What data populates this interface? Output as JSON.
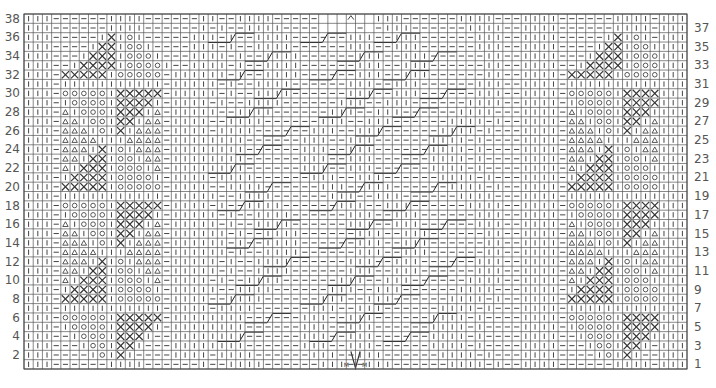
{
  "chart": {
    "rows": 38,
    "cols": 72,
    "grid": {
      "left": 24,
      "top": 14,
      "right": 687,
      "bottom": 369
    },
    "colors": {
      "line": "#555555",
      "symbol": "#444444",
      "background": "#ffffff"
    },
    "left_row_numbers": [
      "2",
      "4",
      "6",
      "8",
      "10",
      "12",
      "14",
      "16",
      "18",
      "20",
      "22",
      "24",
      "26",
      "28",
      "30",
      "32",
      "34",
      "36",
      "38"
    ],
    "right_row_numbers": [
      "1",
      "3",
      "5",
      "7",
      "9",
      "11",
      "13",
      "15",
      "17",
      "19",
      "21",
      "23",
      "25",
      "27",
      "29",
      "31",
      "33",
      "35",
      "37"
    ],
    "legend_symbols": {
      "|": "knit",
      "-": "purl",
      "o": "circle",
      "x": "cross",
      "t": "triangle",
      " ": "no stitch",
      "^": "decrease",
      "m": "make one"
    },
    "panel_left_rows": {
      "38": "|||------||||------||",
      "37": "|||------||||------||",
      "36": "|||-----|x|o|-----|||",
      "35": "|||----|xx|oo|----|||",
      "34": "|||---|xxx|ooo|---|||",
      "33": "|||--|xxxx|oooo|--|||",
      "32": "|||-xxxxx|ooooo-||||",
      "31": "|||-|||||||||||-||||",
      "30": "|||-ooooo|xxxxx-||||",
      "29": "|||-|oooo|xxxx|-||||",
      "28": "|||-t|ooo|xxx|t-||||",
      "27": "|||-tt|oo|xx|tt-||||",
      "26": "|||-ttt|o|x|ttt-||||",
      "25": "|||-tttt|||tttt-||||",
      "24": "|||-ttt|x|o|ttt-||||",
      "23": "|||-tt|xx|oo|tt-||||",
      "22": "|||-t|xxx|ooo|t-||||",
      "21": "|||-|xxxx|oooo|-||||",
      "20": "|||-xxxxx|ooooo-||||",
      "19": "|||-|||||||||||-||||",
      "18": "|||-ooooo|xxxxx-||||",
      "17": "|||-|oooo|xxxx|-||||",
      "16": "|||-t|ooo|xxx|t-||||",
      "15": "|||-tt|oo|xx|tt-||||",
      "14": "|||-ttt|o|x|ttt-||||",
      "13": "|||-tttt|||tttt-||||",
      "12": "|||-ttt|x|o|ttt-||||",
      "11": "|||-tt|xx|oo|tt-||||",
      "10": "|||-t|xxx|ooo|t-||||",
      "9": "|||-|xxxx|oooo|-||||",
      "8": "|||-xxxxx|ooooo-||||",
      "7": "|||-|||||||||||-||||",
      "6": "|||-ooooo|xxxxx-||||",
      "5": "|||-|oooo|xxxx|-||||",
      "4": "|||--|ooo|xxx|--||||",
      "3": "|||---|oo|xx|---||||",
      "2": "|||----|o|x|----||||",
      "1": "|||------||||------|"
    },
    "center_note": "Central cable panel with sloped cable lines; row 38 top has no-stitch cells and decrease symbol; row 1-2 center has make-one (M) and decrease (V) symbols",
    "center_marks": {
      "top_symbol": "^",
      "bottom_left": "M",
      "bottom_center": "V",
      "bottom_right": "M"
    }
  }
}
